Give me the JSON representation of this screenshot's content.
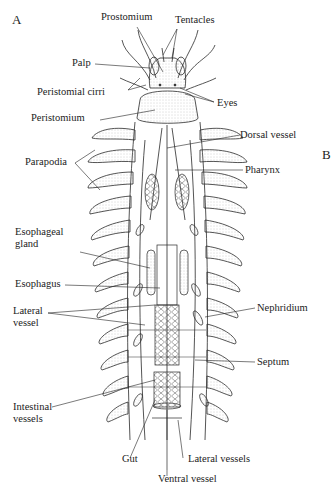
{
  "figure": {
    "panel_labels": {
      "a": "A",
      "b": "B"
    },
    "labels": {
      "prostomium": "Prostomium",
      "tentacles": "Tentacles",
      "palp": "Palp",
      "peristomial_cirri": "Peristomial cirri",
      "eyes": "Eyes",
      "peristomium": "Peristomium",
      "dorsal_vessel": "Dorsal vessel",
      "parapodia": "Parapodia",
      "pharynx": "Pharynx",
      "esophageal_gland_1": "Esophageal",
      "esophageal_gland_2": "gland",
      "esophagus": "Esophagus",
      "lateral_vessel_1": "Lateral",
      "lateral_vessel_2": "vessel",
      "nephridium": "Nephridium",
      "septum": "Septum",
      "intestinal_vessels_1": "Intestinal",
      "intestinal_vessels_2": "vessels",
      "gut": "Gut",
      "lateral_vessels": "Lateral vessels",
      "ventral_vessel": "Ventral vessel"
    },
    "colors": {
      "ink": "#222222",
      "fill": "#f4f4f4",
      "stipple": "#bdbdbd"
    }
  }
}
